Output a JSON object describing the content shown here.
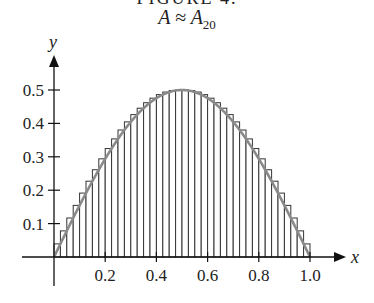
{
  "figure": {
    "title_clipped": "FIGURE 4.",
    "subtitle_main": "A ≈ A",
    "subtitle_sub": "20"
  },
  "chart_data": {
    "type": "area",
    "title": "A ≈ A20",
    "xlabel": "x",
    "ylabel": "y",
    "xlim": [
      0,
      1.0
    ],
    "ylim": [
      0,
      0.5
    ],
    "x_ticks": [
      0.2,
      0.4,
      0.6,
      0.8,
      1.0
    ],
    "x_tick_labels": [
      "0.2",
      "0.4",
      "0.6",
      "0.8",
      "1.0"
    ],
    "y_ticks": [
      0.1,
      0.2,
      0.3,
      0.4,
      0.5
    ],
    "y_tick_labels": [
      "0.1",
      "0.2",
      "0.3",
      "0.4",
      "0.5"
    ],
    "grid": false,
    "legend": null,
    "curve": {
      "description": "smooth hump from (0,0) peaking at (0.5,0.5) returning to (1,0), approx y = 0.5·sin(πx)",
      "color": "#8a8a8a",
      "x": [
        0,
        0.1,
        0.2,
        0.3,
        0.4,
        0.5,
        0.6,
        0.7,
        0.8,
        0.9,
        1.0
      ],
      "y": [
        0,
        0.155,
        0.294,
        0.405,
        0.476,
        0.5,
        0.476,
        0.405,
        0.294,
        0.155,
        0
      ]
    },
    "rectangles": {
      "kind": "upper (circumscribed) sum",
      "observed_strip_count": 40,
      "strip_width": 0.025,
      "fill": "#ffffff",
      "stroke": "#222222"
    }
  },
  "colors": {
    "axis": "#111111",
    "curve": "#8a8a8a",
    "rect_stroke": "#333333",
    "text": "#222222"
  }
}
